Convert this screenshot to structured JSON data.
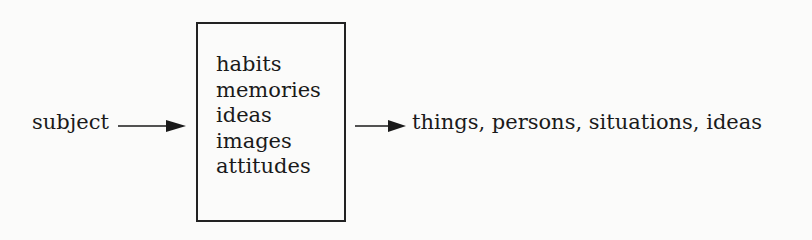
{
  "diagram": {
    "input_label": "subject",
    "box_items": [
      "habits",
      "memories",
      "ideas",
      "images",
      "attitudes"
    ],
    "output_label": "things, persons, situations, ideas",
    "colors": {
      "ink": "#1a1a1a",
      "background": "#fbfbfa"
    }
  }
}
